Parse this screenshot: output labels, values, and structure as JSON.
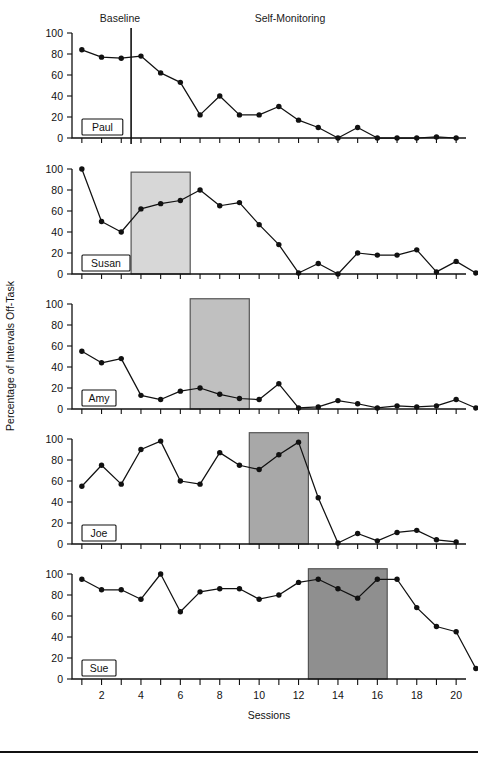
{
  "figure": {
    "phase_labels": [
      {
        "text": "Baseline",
        "x": 120
      },
      {
        "text": "Self-Monitoring",
        "x": 290
      }
    ],
    "x_axis_title": "Sessions",
    "y_axis_title": "Percentage of Intervals Off-Task",
    "x_ticks_labeled": [
      2,
      4,
      6,
      8,
      10,
      12,
      14,
      16,
      18,
      20
    ],
    "y_ticks": [
      0,
      20,
      40,
      60,
      80,
      100
    ],
    "colors": {
      "line": "#111111",
      "marker": "#111111",
      "shade_1": "#d7d7d7",
      "shade_2": "#c0c0c0",
      "shade_3": "#a8a8a8",
      "shade_4": "#8f8f8f",
      "axis": "#111111",
      "background": "#ffffff"
    }
  },
  "chart_data": {
    "type": "line",
    "title": "",
    "xlabel": "Sessions",
    "ylabel": "Percentage of Intervals Off-Task",
    "xlim": [
      0.5,
      20.5
    ],
    "ylim": [
      0,
      100
    ],
    "grid": false,
    "legend": "none",
    "design": "multiple-baseline across participants",
    "phases": [
      "Baseline",
      "Self-Monitoring"
    ],
    "x": [
      1,
      2,
      3,
      4,
      5,
      6,
      7,
      8,
      9,
      10,
      11,
      12,
      13,
      14,
      15,
      16,
      17,
      18,
      19,
      20
    ],
    "panels": [
      {
        "name": "Paul",
        "baseline_end_session": 3,
        "phase_line_x": 3.5,
        "shade": null,
        "values": [
          84,
          77,
          76,
          78,
          62,
          53,
          22,
          40,
          22,
          22,
          30,
          17,
          10,
          0,
          10,
          0,
          0,
          0,
          1,
          0
        ]
      },
      {
        "name": "Susan",
        "baseline_end_session": 3,
        "phase_line_x": 3.5,
        "shade": {
          "from": 3.5,
          "to": 6.5,
          "level": 1,
          "height": 97
        },
        "values": [
          100,
          50,
          40,
          62,
          67,
          70,
          80,
          65,
          68,
          47,
          28,
          1,
          10,
          0,
          20,
          18,
          18,
          23,
          2,
          12,
          1
        ]
      },
      {
        "name": "Amy",
        "baseline_end_session": 6,
        "phase_line_x": 6.5,
        "shade": {
          "from": 6.5,
          "to": 9.5,
          "level": 2,
          "height": 105
        },
        "values": [
          55,
          44,
          48,
          13,
          9,
          17,
          20,
          14,
          10,
          9,
          24,
          1,
          2,
          8,
          5,
          1,
          3,
          2,
          3,
          9,
          1
        ]
      },
      {
        "name": "Joe",
        "baseline_end_session": 9,
        "phase_line_x": 9.5,
        "shade": {
          "from": 9.5,
          "to": 12.5,
          "level": 3,
          "height": 106
        },
        "values": [
          55,
          75,
          57,
          90,
          98,
          60,
          57,
          87,
          75,
          71,
          85,
          97,
          44,
          1,
          10,
          3,
          11,
          13,
          4,
          2
        ]
      },
      {
        "name": "Sue",
        "baseline_end_session": 12,
        "phase_line_x": 12.5,
        "shade": {
          "from": 12.5,
          "to": 16.5,
          "level": 4,
          "height": 105
        },
        "values": [
          95,
          85,
          85,
          76,
          100,
          64,
          83,
          86,
          86,
          76,
          80,
          92,
          95,
          86,
          77,
          95,
          95,
          68,
          50,
          45,
          10
        ]
      }
    ]
  }
}
